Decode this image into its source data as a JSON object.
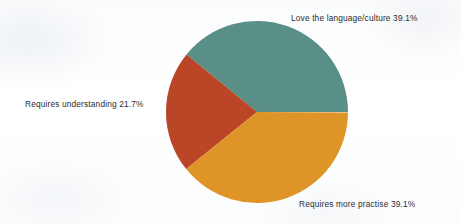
{
  "page": {
    "background_color": "#fdfdfd",
    "width": 461,
    "height": 224
  },
  "chart_data": {
    "type": "pie",
    "title": "",
    "subtitle": "",
    "xlabel": "",
    "ylabel": "",
    "legend_position": "none",
    "grid": false,
    "labels_shown_as": "outside-slice-labels",
    "units": "percent",
    "total": 99.9,
    "center": {
      "x": 257,
      "y": 112
    },
    "radius": 91,
    "start_angle_deg": 0,
    "direction": "counterclockwise",
    "categories": [
      "Love the language/culture",
      "Requires understanding",
      "Requires more practise"
    ],
    "values": [
      39.1,
      21.7,
      39.1
    ],
    "colors": [
      "#5a8f88",
      "#ba4527",
      "#df9427"
    ],
    "slices": [
      {
        "name": "Love the language/culture",
        "value": 39.1,
        "percent_text": "39.1%",
        "label_text": "Love the language/culture  39.1%",
        "color": "#5a8f88",
        "start_angle_deg": 0,
        "end_angle_deg": 140.76,
        "label_position": "top-right"
      },
      {
        "name": "Requires understanding",
        "value": 21.7,
        "percent_text": "21.7%",
        "label_text": "Requires understanding  21.7%",
        "color": "#ba4527",
        "start_angle_deg": 140.76,
        "end_angle_deg": 218.88,
        "label_position": "left"
      },
      {
        "name": "Requires more practise",
        "value": 39.1,
        "percent_text": "39.1%",
        "label_text": "Requires more practise  39.1%",
        "color": "#df9427",
        "start_angle_deg": 218.88,
        "end_angle_deg": 359.64,
        "label_position": "bottom-right"
      }
    ]
  }
}
